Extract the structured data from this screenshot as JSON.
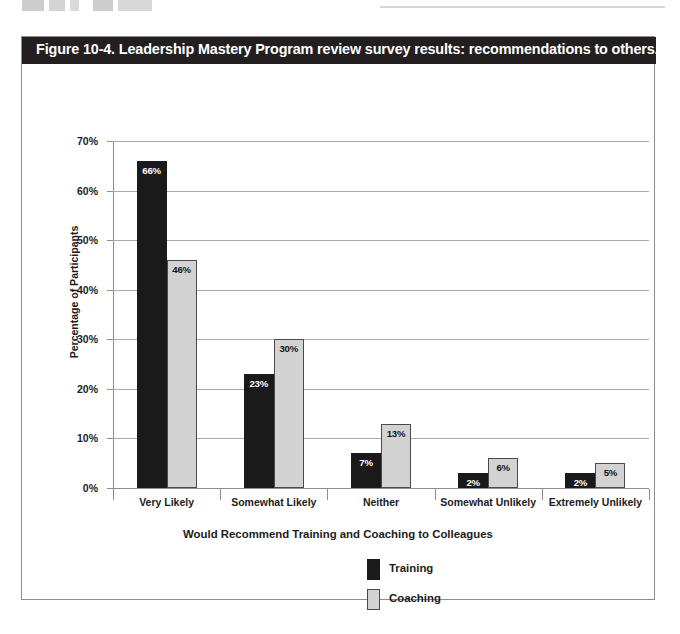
{
  "figure": {
    "title": "Figure 10-4. Leadership Mastery Program review survey results: recommendations to others.",
    "title_bar_color": "#231f20",
    "frame_color": "#8d8d8d"
  },
  "chart_data": {
    "type": "bar",
    "title": "",
    "xlabel": "Would Recommend Training and Coaching to Colleagues",
    "ylabel": "Percentage of Participants",
    "categories": [
      "Very Likely",
      "Somewhat Likely",
      "Neither",
      "Somewhat Unlikely",
      "Extremely Unlikely"
    ],
    "series": [
      {
        "name": "Training",
        "color": "#1a1a1a",
        "values": [
          66,
          23,
          7,
          2,
          2
        ],
        "labels": [
          "66%",
          "23%",
          "7%",
          "2%",
          "2%"
        ]
      },
      {
        "name": "Coaching",
        "color": "#d3d3d3",
        "values": [
          46,
          30,
          13,
          6,
          5
        ],
        "labels": [
          "46%",
          "30%",
          "13%",
          "6%",
          "5%"
        ]
      }
    ],
    "ylim": [
      0,
      70
    ],
    "yticks": [
      0,
      10,
      20,
      30,
      40,
      50,
      60,
      70
    ],
    "ytick_labels": [
      "0%",
      "10%",
      "20%",
      "30%",
      "40%",
      "50%",
      "60%",
      "70%"
    ],
    "grid": true,
    "legend_position": "bottom-center",
    "value_labels": true
  }
}
